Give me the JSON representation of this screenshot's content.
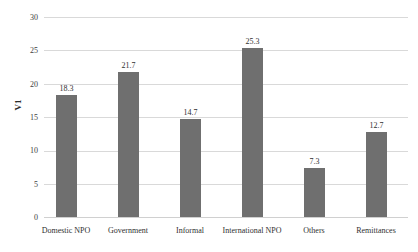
{
  "chart_data": {
    "type": "bar",
    "title": "",
    "subtitle": "",
    "xlabel": "",
    "ylabel": "V1",
    "categories": [
      "Domestic NPO",
      "Government",
      "Informal",
      "International NPO",
      "Others",
      "Remittances"
    ],
    "values": [
      18.3,
      21.7,
      14.7,
      25.3,
      7.3,
      12.7
    ],
    "data_labels": [
      "18.3",
      "21.7",
      "14.7",
      "25.3",
      "7.3",
      "12.7"
    ],
    "ylim": [
      0,
      30
    ],
    "ytick_values": [
      0,
      5,
      10,
      15,
      20,
      25,
      30
    ],
    "ytick_labels": [
      "0",
      "5",
      "10",
      "15",
      "20",
      "25",
      "30"
    ],
    "grid": "horizontal",
    "legend": "none",
    "bar_color": "#6f6f6f",
    "gridline_color": "#d9d9d9",
    "text_color": "#2f2f2f",
    "background": "#ffffff"
  }
}
